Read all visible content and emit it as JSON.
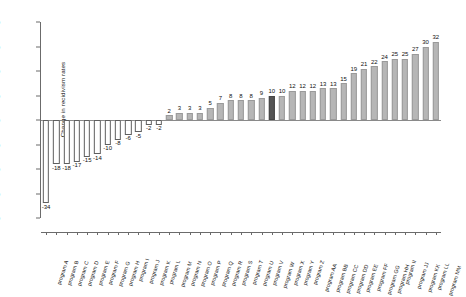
{
  "chart_data": {
    "type": "bar",
    "title": "",
    "xlabel": "",
    "ylabel": "Change in recidivism rates",
    "ylim": [
      -40,
      40
    ],
    "yticks": [
      40,
      30,
      20,
      10,
      0,
      -10,
      -20,
      -30,
      -40
    ],
    "ytick_labels": [
      "40",
      "30",
      "20",
      "10",
      "0",
      "-10",
      "-20",
      "-30",
      "-40"
    ],
    "grid": false,
    "legend": "none",
    "highlight_index": 22,
    "highlight_color": "#545454",
    "bar_color": "#b6b6b6",
    "negative_bar_color": "#ffffff",
    "negative_bar_edge": "#5f5f5f",
    "categories": [
      "program A",
      "program B",
      "program C",
      "program D",
      "program E",
      "program F",
      "program G",
      "program H",
      "program I",
      "program J",
      "program K",
      "program L",
      "program M",
      "program N",
      "program O",
      "program P",
      "program Q",
      "program R",
      "program S",
      "program T",
      "program U",
      "program V",
      "program W",
      "program X",
      "program Y",
      "program Z",
      "program AA",
      "program BB",
      "program CC",
      "program DD",
      "program EE",
      "program FF",
      "program GG",
      "program HH",
      "program II",
      "program JJ",
      "program KK",
      "program LL",
      "program MM"
    ],
    "values": [
      -34,
      -18,
      -18,
      -17,
      -15,
      -14,
      -10,
      -8,
      -6,
      -5,
      -2,
      -2,
      2,
      3,
      3,
      3,
      5,
      7,
      8,
      8,
      8,
      9,
      10,
      10,
      12,
      12,
      12,
      13,
      13,
      15,
      19,
      21,
      22,
      24,
      25,
      25,
      27,
      30,
      32
    ],
    "value_labels": [
      "-34",
      "-18",
      "-18",
      "-17",
      "-15",
      "-14",
      "-10",
      "-8",
      "-6",
      "-5",
      "-2",
      "-2",
      "2",
      "3",
      "3",
      "3",
      "5",
      "7",
      "8",
      "8",
      "8",
      "9",
      "10",
      "10",
      "12",
      "12",
      "12",
      "13",
      "13",
      "15",
      "19",
      "21",
      "22",
      "24",
      "25",
      "25",
      "27",
      "30",
      "32"
    ]
  }
}
